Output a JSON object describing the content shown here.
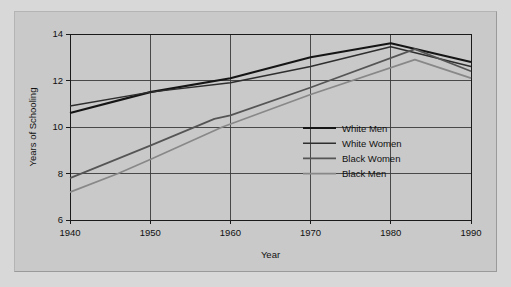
{
  "chart_data": {
    "type": "line",
    "title": "",
    "xlabel": "Year",
    "ylabel": "Years of Schooling",
    "xlim": [
      1940,
      1990
    ],
    "ylim": [
      6,
      14
    ],
    "xticks": [
      1940,
      1950,
      1960,
      1970,
      1980,
      1990
    ],
    "xtick_labels": [
      "1940",
      "1950",
      "1960",
      "1970",
      "1980",
      "1990"
    ],
    "yticks": [
      6,
      8,
      10,
      12,
      14
    ],
    "ytick_labels": [
      "6",
      "8",
      "10",
      "12",
      "14"
    ],
    "grid": true,
    "legend_position": "center-right",
    "series": [
      {
        "name": "White Men",
        "color": "#151515",
        "width": 2.1,
        "x": [
          1940,
          1950,
          1960,
          1970,
          1980,
          1990
        ],
        "values": [
          10.6,
          11.5,
          12.1,
          13.0,
          13.6,
          12.8
        ]
      },
      {
        "name": "White Women",
        "color": "#2e2e2e",
        "width": 1.5,
        "x": [
          1940,
          1950,
          1960,
          1970,
          1980,
          1990
        ],
        "values": [
          10.9,
          11.5,
          11.9,
          12.6,
          13.45,
          12.6
        ]
      },
      {
        "name": "Black Women",
        "color": "#555555",
        "width": 1.7,
        "x": [
          1940,
          1950,
          1958,
          1960,
          1970,
          1983,
          1990
        ],
        "values": [
          7.8,
          9.2,
          10.35,
          10.5,
          11.7,
          13.35,
          12.4
        ]
      },
      {
        "name": "Black Men",
        "color": "#888888",
        "width": 1.7,
        "x": [
          1940,
          1946,
          1950,
          1959,
          1970,
          1983,
          1990
        ],
        "values": [
          7.2,
          8.0,
          8.6,
          10.0,
          11.4,
          12.9,
          12.1
        ]
      }
    ]
  },
  "legend": {
    "entries": [
      {
        "label": "White Men"
      },
      {
        "label": "White Women"
      },
      {
        "label": "Black Women"
      },
      {
        "label": "Black Men"
      }
    ]
  },
  "axes": {
    "y_title": "Years of Schooling",
    "x_title": "Year"
  }
}
